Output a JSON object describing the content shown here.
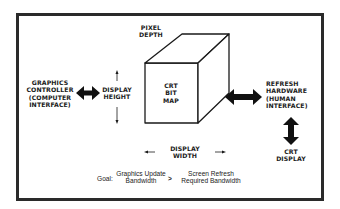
{
  "diagram": {
    "title": "",
    "cube": {
      "front_label": [
        "CRT",
        "BIT",
        "MAP"
      ],
      "depth_label": [
        "PIXEL",
        "DEPTH"
      ],
      "height_label": [
        "DISPLAY",
        "HEIGHT"
      ],
      "width_label": [
        "DISPLAY",
        "WIDTH"
      ]
    },
    "left_node": {
      "label": [
        "GRAPHICS",
        "CONTROLLER",
        "(COMPUTER",
        "INTERFACE)"
      ]
    },
    "right_node": {
      "label": [
        "REFRESH",
        "HARDWARE",
        "(HUMAN",
        "INTERFACE)"
      ]
    },
    "bottom_right_node": {
      "label": [
        "CRT",
        "DISPLAY"
      ]
    },
    "goal": {
      "prefix": "Goal:",
      "left_term": [
        "Graphics Update",
        "Bandwidth"
      ],
      "operator": ">",
      "right_term": [
        "Screen Refresh",
        "Required Bandwidth"
      ]
    },
    "edges": [
      {
        "from": "left_node",
        "to": "cube",
        "type": "bidirectional"
      },
      {
        "from": "cube",
        "to": "right_node",
        "type": "bidirectional"
      },
      {
        "from": "right_node",
        "to": "bottom_right_node",
        "type": "bidirectional"
      }
    ],
    "colors": {
      "ink": "#1a1a1a",
      "background": "#ffffff",
      "frame": "#2a2a2a"
    }
  }
}
